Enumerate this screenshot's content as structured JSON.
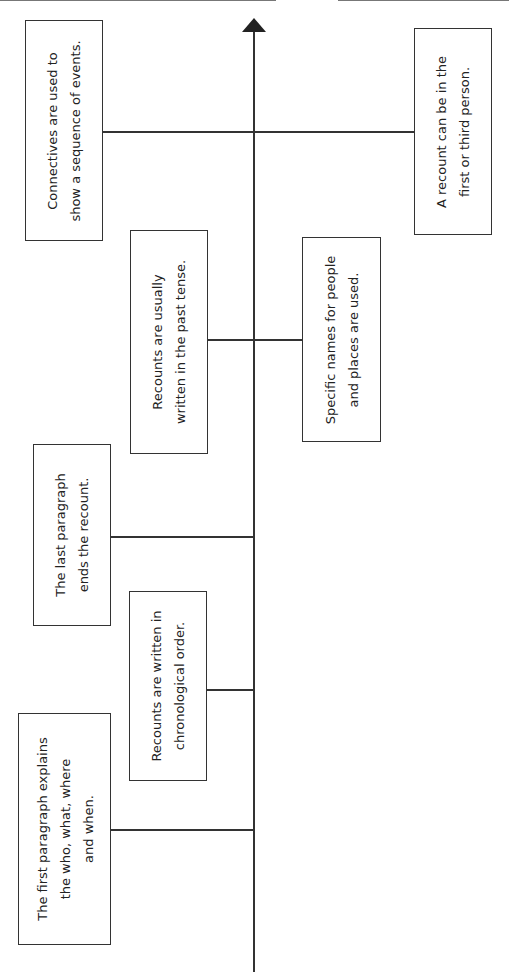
{
  "diagram": {
    "type": "vertical-timeline",
    "orientation": "rotated-90",
    "axis_direction": "up",
    "page_number": "Unit",
    "colors": {
      "line": "#333333",
      "background": "#ffffff",
      "text": "#222222"
    },
    "boxes": [
      {
        "id": "connectives",
        "side": "left",
        "text": "Connectives are used to\nshow a sequence of events."
      },
      {
        "id": "first-or-third-person",
        "side": "right",
        "text": "A recount can be in the\nfirst or third person."
      },
      {
        "id": "past-tense",
        "side": "left",
        "text": "Recounts are usually\nwritten in the past tense."
      },
      {
        "id": "specific-names",
        "side": "right",
        "text": "Specific names for people\nand places are used."
      },
      {
        "id": "last-paragraph",
        "side": "left",
        "text": "The last paragraph\nends the recount."
      },
      {
        "id": "chronological-order",
        "side": "left",
        "text": "Recounts are written in\nchronological order."
      },
      {
        "id": "first-paragraph",
        "side": "left",
        "text": "The first paragraph explains\nthe who, what, where\nand when."
      }
    ]
  }
}
